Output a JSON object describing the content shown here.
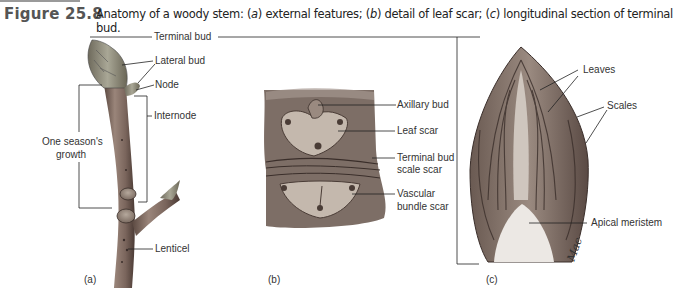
{
  "figure": {
    "number": "Figure 25.8",
    "caption_parts": [
      "Anatomy of a woody stem: (",
      "a",
      ") external features; (",
      "b",
      ") detail of leaf scar; (",
      "c",
      ") longitudinal section of terminal bud."
    ]
  },
  "panel_a": {
    "label": "(a)",
    "labels": {
      "terminal_bud": "Terminal bud",
      "lateral_bud": "Lateral bud",
      "node": "Node",
      "internode": "Internode",
      "season_growth_line1": "One season's",
      "season_growth_line2": "growth",
      "lenticel": "Lenticel"
    }
  },
  "panel_b": {
    "label": "(b)",
    "labels": {
      "axillary_bud": "Axillary bud",
      "leaf_scar": "Leaf scar",
      "terminal_bud_scale_scar_line1": "Terminal bud",
      "terminal_bud_scale_scar_line2": "scale scar",
      "vascular_bundle_scar_line1": "Vascular",
      "vascular_bundle_scar_line2": "bundle scar"
    }
  },
  "panel_c": {
    "label": "(c)",
    "labels": {
      "leaves": "Leaves",
      "scales": "Scales",
      "apical_meristem": "Apical meristem"
    },
    "signature": "Mac"
  },
  "colors": {
    "bark": "#8a7468",
    "bark_dark": "#5a4840",
    "scar": "#c9bdb0",
    "bud_green": "#9a9a88",
    "meristem": "#ece8e4",
    "leader": "#222222"
  }
}
